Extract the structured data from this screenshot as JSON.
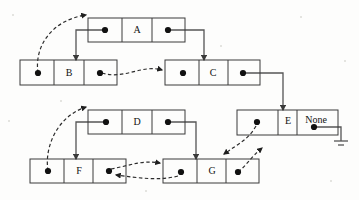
{
  "diagram": {
    "kind": "linked-list-diagram",
    "canvas": {
      "width": 359,
      "height": 200
    },
    "colors": {
      "background": "#fdfdfc",
      "node_stroke": "#3a3a3a",
      "pointer_dot": "#111111",
      "solid_link": "#555555",
      "dashed_link": "#2b2b2b",
      "text": "#111111"
    },
    "nodes": [
      {
        "id": "A",
        "label": "A",
        "x": 88,
        "y": 18,
        "width": 97,
        "height": 24,
        "cells": [
          "prev-pointer",
          "value",
          "next-pointer"
        ],
        "prev_dot": {
          "cx": 106,
          "cy": 30
        },
        "next_dot": {
          "cx": 168,
          "cy": 30
        },
        "label_x": 137,
        "label_y": 31
      },
      {
        "id": "B",
        "label": "B",
        "x": 20,
        "y": 60,
        "width": 97,
        "height": 25,
        "cells": [
          "prev-pointer",
          "value",
          "next-pointer"
        ],
        "prev_dot": {
          "cx": 38,
          "cy": 73
        },
        "next_dot": {
          "cx": 100,
          "cy": 73
        },
        "label_x": 69,
        "label_y": 73
      },
      {
        "id": "C",
        "label": "C",
        "x": 165,
        "y": 60,
        "width": 95,
        "height": 25,
        "cells": [
          "prev-pointer",
          "value",
          "next-pointer"
        ],
        "prev_dot": {
          "cx": 183,
          "cy": 73
        },
        "next_dot": {
          "cx": 243,
          "cy": 73
        },
        "label_x": 213,
        "label_y": 73
      },
      {
        "id": "D",
        "label": "D",
        "x": 88,
        "y": 110,
        "width": 97,
        "height": 24,
        "cells": [
          "prev-pointer",
          "value",
          "next-pointer"
        ],
        "prev_dot": {
          "cx": 106,
          "cy": 122
        },
        "next_dot": {
          "cx": 168,
          "cy": 122
        },
        "label_x": 137,
        "label_y": 123
      },
      {
        "id": "E",
        "label": "E",
        "x": 237,
        "y": 110,
        "width": 101,
        "height": 25,
        "cells": [
          "prev-pointer",
          "value",
          "next-none"
        ],
        "prev_dot": {
          "cx": 258,
          "cy": 122
        },
        "next_dot": {
          "cx": 314,
          "cy": 127
        },
        "label_x": 288,
        "label_y": 122,
        "none_label": "None",
        "none_label_x": 314,
        "none_label_y": 121,
        "terminated": true
      },
      {
        "id": "F",
        "label": "F",
        "x": 30,
        "y": 159,
        "width": 96,
        "height": 24,
        "cells": [
          "prev-pointer",
          "value",
          "next-pointer"
        ],
        "prev_dot": {
          "cx": 48,
          "cy": 171
        },
        "next_dot": {
          "cx": 109,
          "cy": 171
        },
        "label_x": 79,
        "label_y": 172
      },
      {
        "id": "G",
        "label": "G",
        "x": 163,
        "y": 159,
        "width": 96,
        "height": 24,
        "cells": [
          "prev-pointer",
          "value",
          "next-pointer"
        ],
        "prev_dot": {
          "cx": 181,
          "cy": 172
        },
        "next_dot": {
          "cx": 238,
          "cy": 172
        },
        "label_x": 212,
        "label_y": 172
      }
    ],
    "links": [
      {
        "id": "A-next-to-C",
        "from": "A",
        "to": "C",
        "style": "solid",
        "kind": "next"
      },
      {
        "id": "A-prev-to-B",
        "from": "A",
        "to": "B",
        "style": "solid",
        "kind": "prev"
      },
      {
        "id": "B-prev-to-A",
        "from": "B",
        "to": "A",
        "style": "dashed",
        "kind": "prev"
      },
      {
        "id": "B-next-to-C",
        "from": "B",
        "to": "C",
        "style": "dashed",
        "kind": "next"
      },
      {
        "id": "C-next-to-E",
        "from": "C",
        "to": "E",
        "style": "solid",
        "kind": "next"
      },
      {
        "id": "D-prev-to-F",
        "from": "D",
        "to": "F",
        "style": "solid",
        "kind": "prev"
      },
      {
        "id": "D-next-to-G",
        "from": "D",
        "to": "G",
        "style": "solid",
        "kind": "next"
      },
      {
        "id": "E-prev-to-G",
        "from": "E",
        "to": "G",
        "style": "dashed",
        "kind": "prev"
      },
      {
        "id": "E-next-to-none",
        "from": "E",
        "to": "None",
        "style": "ground",
        "kind": "next"
      },
      {
        "id": "F-prev-to-D",
        "from": "F",
        "to": "D",
        "style": "dashed",
        "kind": "prev"
      },
      {
        "id": "F-next-to-G",
        "from": "F",
        "to": "G",
        "style": "dashed",
        "kind": "next"
      },
      {
        "id": "G-prev-to-F",
        "from": "G",
        "to": "F",
        "style": "dashed",
        "kind": "prev"
      },
      {
        "id": "G-next-to-E",
        "from": "G",
        "to": "E",
        "style": "dashed",
        "kind": "next"
      }
    ]
  }
}
